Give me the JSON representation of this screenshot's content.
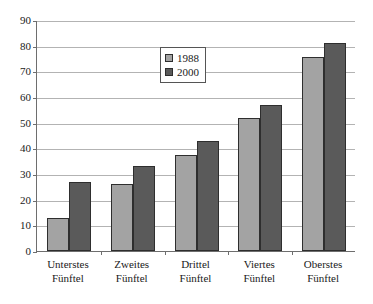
{
  "chart_data": {
    "type": "bar",
    "title": "",
    "subtitle": "",
    "xlabel": "",
    "ylabel": "",
    "ylim": [
      0,
      90
    ],
    "ytick_step": 10,
    "yticks": [
      "0",
      "10",
      "20",
      "30",
      "40",
      "50",
      "60",
      "70",
      "80",
      "90"
    ],
    "grid": true,
    "legend_position": "inside-top-center",
    "categories": [
      "Unterstes Fünftel",
      "Zweites Fünftel",
      "Drittel Fünftel",
      "Viertes Fünftel",
      "Oberstes Fünftel"
    ],
    "category_lines": [
      [
        "Unterstes",
        "Fünftel"
      ],
      [
        "Zweites",
        "Fünftel"
      ],
      [
        "Drittel",
        "Fünftel"
      ],
      [
        "Viertes",
        "Fünftel"
      ],
      [
        "Oberstes",
        "Fünftel"
      ]
    ],
    "series": [
      {
        "name": "1988",
        "color": "#a3a3a3",
        "values": [
          13,
          26,
          37.5,
          52,
          75.5
        ]
      },
      {
        "name": "2000",
        "color": "#5a5a5a",
        "values": [
          27,
          33,
          43,
          57,
          81
        ]
      }
    ]
  },
  "legend": {
    "entries": [
      {
        "label": "1988",
        "swatch": "legend-swatch-1988"
      },
      {
        "label": "2000",
        "swatch": "legend-swatch-2000"
      }
    ]
  },
  "colors": {
    "series_1988": "#a3a3a3",
    "series_2000": "#5a5a5a",
    "gridline": "#b3b3b3",
    "axis": "#6e6e6e",
    "bar_outline": "#2e2e2e",
    "background": "#ffffff",
    "text": "#1a1a1a"
  }
}
